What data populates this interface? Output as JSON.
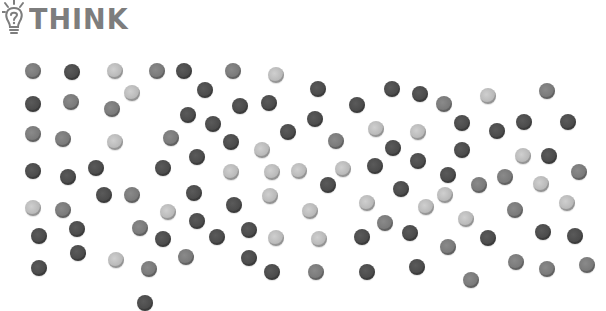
{
  "header": {
    "logo_icon": "lightbulb-question-icon",
    "title": "THINK"
  },
  "colors": {
    "light": "#b8b8b8",
    "medium": "#7a7a7a",
    "dark": "#4a4a4a",
    "logo": "#7d7d7d"
  },
  "dots": [
    {
      "x": 33,
      "y": 71,
      "shade": "medium"
    },
    {
      "x": 72,
      "y": 72,
      "shade": "dark"
    },
    {
      "x": 115,
      "y": 71,
      "shade": "light"
    },
    {
      "x": 157,
      "y": 71,
      "shade": "medium"
    },
    {
      "x": 184,
      "y": 71,
      "shade": "dark"
    },
    {
      "x": 233,
      "y": 71,
      "shade": "medium"
    },
    {
      "x": 276,
      "y": 75,
      "shade": "light"
    },
    {
      "x": 132,
      "y": 93,
      "shade": "light"
    },
    {
      "x": 205,
      "y": 90,
      "shade": "dark"
    },
    {
      "x": 33,
      "y": 104,
      "shade": "dark"
    },
    {
      "x": 71,
      "y": 102,
      "shade": "medium"
    },
    {
      "x": 112,
      "y": 109,
      "shade": "medium"
    },
    {
      "x": 188,
      "y": 115,
      "shade": "dark"
    },
    {
      "x": 240,
      "y": 106,
      "shade": "dark"
    },
    {
      "x": 269,
      "y": 103,
      "shade": "dark"
    },
    {
      "x": 213,
      "y": 124,
      "shade": "dark"
    },
    {
      "x": 288,
      "y": 132,
      "shade": "dark"
    },
    {
      "x": 33,
      "y": 134,
      "shade": "medium"
    },
    {
      "x": 63,
      "y": 139,
      "shade": "medium"
    },
    {
      "x": 115,
      "y": 142,
      "shade": "light"
    },
    {
      "x": 171,
      "y": 138,
      "shade": "medium"
    },
    {
      "x": 231,
      "y": 142,
      "shade": "dark"
    },
    {
      "x": 262,
      "y": 150,
      "shade": "light"
    },
    {
      "x": 197,
      "y": 157,
      "shade": "dark"
    },
    {
      "x": 318,
      "y": 89,
      "shade": "dark"
    },
    {
      "x": 357,
      "y": 105,
      "shade": "dark"
    },
    {
      "x": 392,
      "y": 89,
      "shade": "dark"
    },
    {
      "x": 420,
      "y": 94,
      "shade": "dark"
    },
    {
      "x": 444,
      "y": 104,
      "shade": "medium"
    },
    {
      "x": 488,
      "y": 96,
      "shade": "light"
    },
    {
      "x": 547,
      "y": 91,
      "shade": "medium"
    },
    {
      "x": 315,
      "y": 119,
      "shade": "dark"
    },
    {
      "x": 376,
      "y": 129,
      "shade": "light"
    },
    {
      "x": 418,
      "y": 132,
      "shade": "light"
    },
    {
      "x": 462,
      "y": 123,
      "shade": "dark"
    },
    {
      "x": 497,
      "y": 131,
      "shade": "dark"
    },
    {
      "x": 524,
      "y": 122,
      "shade": "dark"
    },
    {
      "x": 568,
      "y": 122,
      "shade": "dark"
    },
    {
      "x": 336,
      "y": 141,
      "shade": "medium"
    },
    {
      "x": 393,
      "y": 148,
      "shade": "dark"
    },
    {
      "x": 462,
      "y": 150,
      "shade": "dark"
    },
    {
      "x": 523,
      "y": 156,
      "shade": "light"
    },
    {
      "x": 549,
      "y": 156,
      "shade": "dark"
    },
    {
      "x": 418,
      "y": 161,
      "shade": "dark"
    },
    {
      "x": 375,
      "y": 166,
      "shade": "dark"
    },
    {
      "x": 343,
      "y": 169,
      "shade": "light"
    },
    {
      "x": 33,
      "y": 171,
      "shade": "dark"
    },
    {
      "x": 68,
      "y": 177,
      "shade": "dark"
    },
    {
      "x": 96,
      "y": 168,
      "shade": "dark"
    },
    {
      "x": 163,
      "y": 168,
      "shade": "dark"
    },
    {
      "x": 231,
      "y": 172,
      "shade": "light"
    },
    {
      "x": 272,
      "y": 172,
      "shade": "light"
    },
    {
      "x": 299,
      "y": 171,
      "shade": "light"
    },
    {
      "x": 104,
      "y": 195,
      "shade": "dark"
    },
    {
      "x": 132,
      "y": 195,
      "shade": "medium"
    },
    {
      "x": 194,
      "y": 193,
      "shade": "dark"
    },
    {
      "x": 270,
      "y": 196,
      "shade": "light"
    },
    {
      "x": 33,
      "y": 208,
      "shade": "light"
    },
    {
      "x": 63,
      "y": 210,
      "shade": "medium"
    },
    {
      "x": 168,
      "y": 212,
      "shade": "light"
    },
    {
      "x": 234,
      "y": 205,
      "shade": "dark"
    },
    {
      "x": 77,
      "y": 229,
      "shade": "dark"
    },
    {
      "x": 39,
      "y": 236,
      "shade": "dark"
    },
    {
      "x": 140,
      "y": 228,
      "shade": "medium"
    },
    {
      "x": 197,
      "y": 221,
      "shade": "dark"
    },
    {
      "x": 163,
      "y": 239,
      "shade": "dark"
    },
    {
      "x": 217,
      "y": 237,
      "shade": "dark"
    },
    {
      "x": 249,
      "y": 230,
      "shade": "dark"
    },
    {
      "x": 276,
      "y": 238,
      "shade": "light"
    },
    {
      "x": 78,
      "y": 253,
      "shade": "dark"
    },
    {
      "x": 116,
      "y": 260,
      "shade": "light"
    },
    {
      "x": 186,
      "y": 257,
      "shade": "medium"
    },
    {
      "x": 249,
      "y": 258,
      "shade": "dark"
    },
    {
      "x": 39,
      "y": 268,
      "shade": "dark"
    },
    {
      "x": 149,
      "y": 269,
      "shade": "medium"
    },
    {
      "x": 272,
      "y": 272,
      "shade": "dark"
    },
    {
      "x": 448,
      "y": 175,
      "shade": "dark"
    },
    {
      "x": 479,
      "y": 185,
      "shade": "medium"
    },
    {
      "x": 505,
      "y": 177,
      "shade": "medium"
    },
    {
      "x": 541,
      "y": 184,
      "shade": "light"
    },
    {
      "x": 579,
      "y": 172,
      "shade": "medium"
    },
    {
      "x": 328,
      "y": 185,
      "shade": "dark"
    },
    {
      "x": 401,
      "y": 189,
      "shade": "dark"
    },
    {
      "x": 445,
      "y": 195,
      "shade": "light"
    },
    {
      "x": 367,
      "y": 203,
      "shade": "light"
    },
    {
      "x": 426,
      "y": 207,
      "shade": "light"
    },
    {
      "x": 310,
      "y": 211,
      "shade": "light"
    },
    {
      "x": 515,
      "y": 210,
      "shade": "medium"
    },
    {
      "x": 567,
      "y": 203,
      "shade": "light"
    },
    {
      "x": 385,
      "y": 223,
      "shade": "medium"
    },
    {
      "x": 466,
      "y": 219,
      "shade": "light"
    },
    {
      "x": 319,
      "y": 239,
      "shade": "light"
    },
    {
      "x": 362,
      "y": 237,
      "shade": "dark"
    },
    {
      "x": 410,
      "y": 233,
      "shade": "dark"
    },
    {
      "x": 488,
      "y": 238,
      "shade": "dark"
    },
    {
      "x": 543,
      "y": 232,
      "shade": "dark"
    },
    {
      "x": 575,
      "y": 236,
      "shade": "dark"
    },
    {
      "x": 448,
      "y": 247,
      "shade": "medium"
    },
    {
      "x": 316,
      "y": 272,
      "shade": "medium"
    },
    {
      "x": 367,
      "y": 272,
      "shade": "dark"
    },
    {
      "x": 417,
      "y": 267,
      "shade": "dark"
    },
    {
      "x": 516,
      "y": 262,
      "shade": "medium"
    },
    {
      "x": 547,
      "y": 269,
      "shade": "medium"
    },
    {
      "x": 587,
      "y": 265,
      "shade": "medium"
    },
    {
      "x": 471,
      "y": 280,
      "shade": "medium"
    },
    {
      "x": 145,
      "y": 303,
      "shade": "dark"
    }
  ]
}
